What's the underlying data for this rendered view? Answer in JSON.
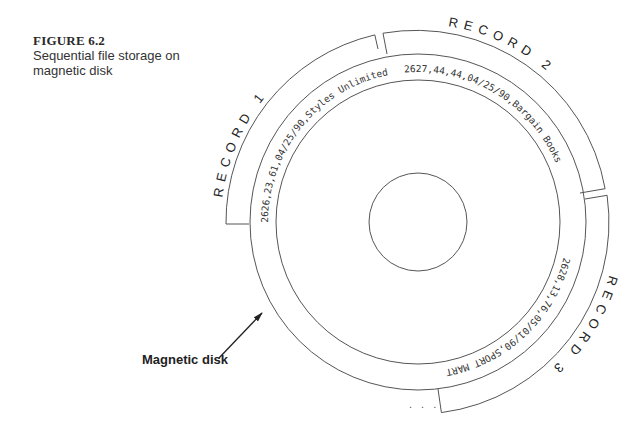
{
  "figure": {
    "number": "FIGURE 6.2",
    "title_line1": "Sequential file storage on",
    "title_line2": "magnetic disk"
  },
  "disk": {
    "label": "Magnetic disk",
    "continuation": ". . ."
  },
  "records": [
    {
      "label": "RECORD 1",
      "data": "2626,23,61,04/25/90,Styles Unlimited"
    },
    {
      "label": "RECORD 2",
      "data": "2627,44,44,04/25/90,Bargain Books"
    },
    {
      "label": "RECORD 3",
      "data": "2628,13,76,05/01/90,SPORT MART"
    }
  ]
}
